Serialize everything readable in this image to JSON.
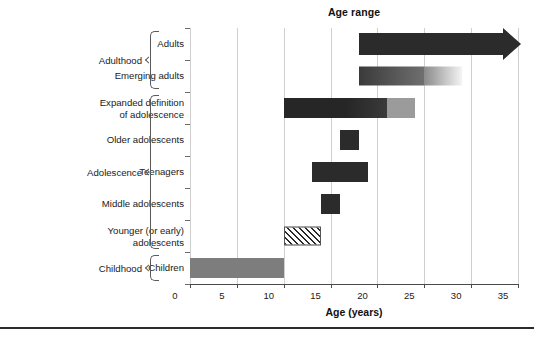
{
  "chart_data": {
    "type": "bar",
    "orientation": "horizontal",
    "title": "Age range",
    "xlabel": "Age (years)",
    "ylabel": "",
    "xlim": [
      0,
      35
    ],
    "xticks": [
      0,
      5,
      10,
      15,
      20,
      25,
      30,
      35
    ],
    "xticklabels": [
      "0",
      "5",
      "10",
      "15",
      "20",
      "25",
      "30",
      "35"
    ],
    "grid": "vertical gridlines at every x tick",
    "legend": "none",
    "categories": [
      "Adults",
      "Emerging adults",
      "Expanded definition of adolescence",
      "Older adolescents",
      "Teenagers",
      "Middle adolescents",
      "Younger (or early) adolescents",
      "Children"
    ],
    "bars": [
      {
        "label": "Adults",
        "label_lines": [
          "Adults"
        ],
        "start": 18,
        "end": 35,
        "open_ended": true,
        "style": "solid-dark-with-arrow",
        "fill": "#2b2b2b",
        "group": "Adulthood"
      },
      {
        "label": "Emerging adults",
        "label_lines": [
          "Emerging adults"
        ],
        "start": 18,
        "end": 29,
        "open_ended": false,
        "style": "gradient-dark-to-white",
        "fill": "#3a3a3a → #f4f4f4",
        "group": "Adulthood"
      },
      {
        "label": "Expanded definition of adolescence",
        "label_lines": [
          "Expanded definition",
          "of adolescence"
        ],
        "start": 10,
        "end": 24,
        "open_ended": false,
        "style": "dark-then-light-segment",
        "segment_break": 21,
        "fill": "#262626 / #8a8a8a",
        "group": "Adolescence"
      },
      {
        "label": "Older adolescents",
        "label_lines": [
          "Older adolescents"
        ],
        "start": 16,
        "end": 18,
        "open_ended": false,
        "style": "solid-dark",
        "fill": "#1f1f1f",
        "group": "Adolescence"
      },
      {
        "label": "Teenagers",
        "label_lines": [
          "Teenagers"
        ],
        "start": 13,
        "end": 19,
        "open_ended": false,
        "style": "solid-dark",
        "fill": "#1f1f1f",
        "group": "Adolescence"
      },
      {
        "label": "Middle adolescents",
        "label_lines": [
          "Middle adolescents"
        ],
        "start": 14,
        "end": 16,
        "open_ended": false,
        "style": "solid-dark",
        "fill": "#1f1f1f",
        "group": "Adolescence"
      },
      {
        "label": "Younger (or early) adolescents",
        "label_lines": [
          "Younger (or early)",
          "adolescents"
        ],
        "start": 10,
        "end": 14,
        "open_ended": false,
        "style": "diagonal-hatch",
        "fill": "hatched",
        "group": "Adolescence"
      },
      {
        "label": "Children",
        "label_lines": [
          "Children"
        ],
        "start": 0,
        "end": 10,
        "open_ended": false,
        "style": "solid-mid-gray",
        "fill": "#7d7d7d",
        "group": "Childhood"
      }
    ],
    "groups": [
      {
        "label": "Adulthood",
        "rows": [
          0,
          1
        ]
      },
      {
        "label": "Adolescence",
        "rows": [
          2,
          3,
          4,
          5,
          6
        ]
      },
      {
        "label": "Childhood",
        "rows": [
          7
        ]
      }
    ]
  },
  "colors": {
    "axis": "#4a4a4a",
    "grid": "#cfcfcf",
    "text": "#1a1a1a",
    "bar_dark": "#2b2b2b",
    "bar_mid": "#7d7d7d",
    "bar_light": "#9b9b9b",
    "rule": "#2b2b2b"
  }
}
